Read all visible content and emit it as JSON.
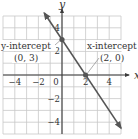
{
  "chart_data": {
    "type": "line",
    "title": "",
    "xlabel": "x",
    "ylabel": "y",
    "xlim": [
      -5,
      5
    ],
    "ylim": [
      -5,
      5
    ],
    "grid": true,
    "x_ticks": [
      -4,
      -2,
      0,
      2,
      4
    ],
    "y_ticks": [
      -4,
      -2,
      2,
      4
    ],
    "x_tick_labels": [
      "−4",
      "−2",
      "0",
      "2",
      "4"
    ],
    "y_tick_labels": [
      "−4",
      "−2",
      "2",
      "4"
    ],
    "series": [
      {
        "name": "line",
        "equation": "y = -3/2 x + 3",
        "x": [
          -1.5,
          0,
          2,
          5
        ],
        "y": [
          5.25,
          3,
          0,
          -4.5
        ],
        "arrows": "both"
      }
    ],
    "points": [
      {
        "x": 0,
        "y": 3,
        "label": "(0, 3)",
        "caption": "y-intercept"
      },
      {
        "x": 2,
        "y": 0,
        "label": "(2, 0)",
        "caption": "x-intercept"
      }
    ],
    "annotations": [
      {
        "text": "y-intercept",
        "sub": "(0, 3)"
      },
      {
        "text": "x-intercept",
        "sub": "(2, 0)"
      }
    ]
  },
  "colors": {
    "grid": "#c8c8c8",
    "axis": "#3a3a3a",
    "line": "#555555",
    "point": "#555555",
    "text": "#333333"
  }
}
